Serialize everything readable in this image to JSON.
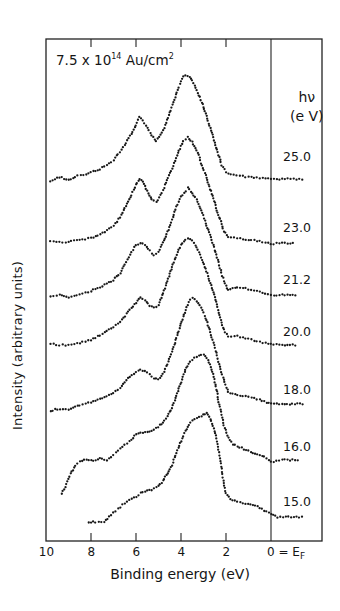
{
  "chart_data": {
    "type": "scatter",
    "title": "",
    "annotation": "7.5 x 10^14 Au/cm^2",
    "annotation_parts": {
      "base": "7.5 x 10",
      "exp": "14",
      "unit": " Au/cm",
      "unit_exp": "2"
    },
    "xlabel": "Binding energy (eV)",
    "ylabel": "Intensity (arbitrary units)",
    "x_reversed": true,
    "xlim": [
      10,
      -1.6
    ],
    "x_ticks": [
      10,
      8,
      6,
      4,
      2,
      0
    ],
    "x_tick_labels": [
      "10",
      "8",
      "6",
      "4",
      "2",
      "0 = E_F"
    ],
    "fermi_line_at": 0,
    "legend_title": "hν (eV)",
    "legend_title_parts": {
      "line1": "hν",
      "line2": "(e V)"
    },
    "grid": false,
    "series": [
      {
        "name": "25.0",
        "offset": 179,
        "label_y": 157,
        "points": [
          [
            9.8,
            -3
          ],
          [
            9.4,
            2
          ],
          [
            9.0,
            -1
          ],
          [
            8.6,
            3
          ],
          [
            8.2,
            4
          ],
          [
            8.0,
            7
          ],
          [
            7.6,
            10
          ],
          [
            7.2,
            15
          ],
          [
            7.0,
            19
          ],
          [
            6.8,
            25
          ],
          [
            6.5,
            34
          ],
          [
            6.2,
            45
          ],
          [
            6.0,
            54
          ],
          [
            5.85,
            62
          ],
          [
            5.7,
            58
          ],
          [
            5.5,
            51
          ],
          [
            5.3,
            44
          ],
          [
            5.1,
            38
          ],
          [
            4.9,
            44
          ],
          [
            4.7,
            54
          ],
          [
            4.5,
            66
          ],
          [
            4.3,
            79
          ],
          [
            4.1,
            92
          ],
          [
            3.9,
            102
          ],
          [
            3.8,
            104
          ],
          [
            3.6,
            102
          ],
          [
            3.4,
            94
          ],
          [
            3.2,
            84
          ],
          [
            3.0,
            72
          ],
          [
            2.8,
            58
          ],
          [
            2.6,
            44
          ],
          [
            2.4,
            29
          ],
          [
            2.2,
            14
          ],
          [
            2.0,
            7
          ],
          [
            1.8,
            4
          ],
          [
            1.4,
            3
          ],
          [
            1.0,
            2
          ],
          [
            0.5,
            1
          ],
          [
            0,
            0
          ],
          [
            -0.5,
            0
          ],
          [
            -1.0,
            0
          ],
          [
            -1.5,
            0
          ]
        ]
      },
      {
        "name": "23.0",
        "offset": 243,
        "label_y": 228,
        "points": [
          [
            9.8,
            2
          ],
          [
            9.4,
            1
          ],
          [
            9.0,
            1
          ],
          [
            8.5,
            3
          ],
          [
            8.0,
            5
          ],
          [
            7.5,
            10
          ],
          [
            7.0,
            17
          ],
          [
            6.7,
            26
          ],
          [
            6.5,
            35
          ],
          [
            6.2,
            48
          ],
          [
            6.0,
            58
          ],
          [
            5.85,
            64
          ],
          [
            5.7,
            61
          ],
          [
            5.5,
            52
          ],
          [
            5.3,
            44
          ],
          [
            5.1,
            41
          ],
          [
            4.9,
            48
          ],
          [
            4.7,
            58
          ],
          [
            4.5,
            70
          ],
          [
            4.3,
            80
          ],
          [
            4.1,
            92
          ],
          [
            3.9,
            102
          ],
          [
            3.7,
            106
          ],
          [
            3.5,
            101
          ],
          [
            3.3,
            93
          ],
          [
            3.1,
            80
          ],
          [
            2.9,
            68
          ],
          [
            2.7,
            54
          ],
          [
            2.5,
            40
          ],
          [
            2.3,
            26
          ],
          [
            2.1,
            12
          ],
          [
            1.9,
            6
          ],
          [
            1.5,
            5
          ],
          [
            1.0,
            3
          ],
          [
            0.5,
            2
          ],
          [
            0,
            -1
          ],
          [
            -0.5,
            0
          ],
          [
            -1.1,
            0
          ]
        ]
      },
      {
        "name": "21.2",
        "offset": 295,
        "label_y": 280,
        "points": [
          [
            9.8,
            -1
          ],
          [
            9.4,
            0
          ],
          [
            9.0,
            -2
          ],
          [
            8.5,
            1
          ],
          [
            8.0,
            4
          ],
          [
            7.5,
            9
          ],
          [
            7.0,
            15
          ],
          [
            6.7,
            22
          ],
          [
            6.5,
            31
          ],
          [
            6.2,
            43
          ],
          [
            6.0,
            50
          ],
          [
            5.8,
            52
          ],
          [
            5.6,
            50
          ],
          [
            5.4,
            44
          ],
          [
            5.2,
            40
          ],
          [
            5.0,
            43
          ],
          [
            4.8,
            52
          ],
          [
            4.6,
            63
          ],
          [
            4.4,
            75
          ],
          [
            4.2,
            88
          ],
          [
            4.0,
            98
          ],
          [
            3.8,
            104
          ],
          [
            3.7,
            107
          ],
          [
            3.5,
            102
          ],
          [
            3.3,
            95
          ],
          [
            3.1,
            84
          ],
          [
            2.9,
            72
          ],
          [
            2.7,
            60
          ],
          [
            2.5,
            45
          ],
          [
            2.3,
            30
          ],
          [
            2.1,
            14
          ],
          [
            1.9,
            5
          ],
          [
            1.5,
            8
          ],
          [
            1.0,
            6
          ],
          [
            0.5,
            3
          ],
          [
            0,
            0
          ],
          [
            -0.5,
            0
          ],
          [
            -1.2,
            0
          ]
        ]
      },
      {
        "name": "20.0",
        "offset": 345,
        "label_y": 332,
        "points": [
          [
            9.8,
            1
          ],
          [
            9.4,
            0
          ],
          [
            9.0,
            0
          ],
          [
            8.5,
            2
          ],
          [
            8.0,
            5
          ],
          [
            7.5,
            11
          ],
          [
            7.0,
            18
          ],
          [
            6.7,
            23
          ],
          [
            6.5,
            29
          ],
          [
            6.2,
            37
          ],
          [
            6.0,
            42
          ],
          [
            5.8,
            48
          ],
          [
            5.6,
            45
          ],
          [
            5.4,
            39
          ],
          [
            5.2,
            37
          ],
          [
            5.0,
            40
          ],
          [
            4.8,
            52
          ],
          [
            4.6,
            64
          ],
          [
            4.4,
            78
          ],
          [
            4.2,
            90
          ],
          [
            4.0,
            100
          ],
          [
            3.8,
            105
          ],
          [
            3.7,
            107
          ],
          [
            3.5,
            104
          ],
          [
            3.3,
            98
          ],
          [
            3.1,
            88
          ],
          [
            2.9,
            76
          ],
          [
            2.7,
            62
          ],
          [
            2.5,
            48
          ],
          [
            2.3,
            30
          ],
          [
            2.1,
            15
          ],
          [
            1.9,
            8
          ],
          [
            1.5,
            9
          ],
          [
            1.0,
            6
          ],
          [
            0.5,
            3
          ],
          [
            0,
            1
          ],
          [
            -0.5,
            0
          ],
          [
            -1.2,
            0
          ]
        ]
      },
      {
        "name": "18.0",
        "offset": 404,
        "label_y": 390,
        "points": [
          [
            9.8,
            -7
          ],
          [
            9.5,
            -5
          ],
          [
            9.0,
            -6
          ],
          [
            8.5,
            -1
          ],
          [
            8.0,
            2
          ],
          [
            7.5,
            6
          ],
          [
            7.0,
            11
          ],
          [
            6.7,
            16
          ],
          [
            6.5,
            22
          ],
          [
            6.2,
            29
          ],
          [
            6.0,
            32
          ],
          [
            5.8,
            34
          ],
          [
            5.6,
            33
          ],
          [
            5.4,
            30
          ],
          [
            5.2,
            26
          ],
          [
            5.0,
            25
          ],
          [
            4.8,
            30
          ],
          [
            4.6,
            40
          ],
          [
            4.4,
            52
          ],
          [
            4.2,
            66
          ],
          [
            4.0,
            80
          ],
          [
            3.8,
            94
          ],
          [
            3.6,
            104
          ],
          [
            3.5,
            106
          ],
          [
            3.3,
            103
          ],
          [
            3.1,
            96
          ],
          [
            2.9,
            86
          ],
          [
            2.7,
            72
          ],
          [
            2.5,
            56
          ],
          [
            2.3,
            40
          ],
          [
            2.1,
            24
          ],
          [
            1.9,
            12
          ],
          [
            1.5,
            9
          ],
          [
            1.0,
            7
          ],
          [
            0.5,
            4
          ],
          [
            0,
            0
          ],
          [
            -0.5,
            0
          ],
          [
            -1.5,
            0
          ]
        ]
      },
      {
        "name": "16.0",
        "offset": 460,
        "label_y": 447,
        "points": [
          [
            9.3,
            -34
          ],
          [
            9.1,
            -24
          ],
          [
            8.9,
            -14
          ],
          [
            8.7,
            -6
          ],
          [
            8.5,
            -2
          ],
          [
            8.2,
            1
          ],
          [
            7.9,
            -1
          ],
          [
            7.6,
            2
          ],
          [
            7.3,
            0
          ],
          [
            7.0,
            5
          ],
          [
            6.8,
            9
          ],
          [
            6.5,
            15
          ],
          [
            6.2,
            20
          ],
          [
            6.0,
            26
          ],
          [
            5.8,
            27
          ],
          [
            5.5,
            28
          ],
          [
            5.2,
            30
          ],
          [
            5.0,
            33
          ],
          [
            4.8,
            38
          ],
          [
            4.6,
            44
          ],
          [
            4.4,
            52
          ],
          [
            4.2,
            64
          ],
          [
            4.0,
            78
          ],
          [
            3.8,
            90
          ],
          [
            3.6,
            98
          ],
          [
            3.4,
            102
          ],
          [
            3.2,
            105
          ],
          [
            3.0,
            105
          ],
          [
            2.8,
            100
          ],
          [
            2.6,
            88
          ],
          [
            2.5,
            78
          ],
          [
            2.3,
            56
          ],
          [
            2.1,
            35
          ],
          [
            1.9,
            22
          ],
          [
            1.7,
            16
          ],
          [
            1.4,
            13
          ],
          [
            1.0,
            9
          ],
          [
            0.6,
            6
          ],
          [
            0.2,
            2
          ],
          [
            0,
            -2
          ],
          [
            -0.5,
            0
          ],
          [
            -1.3,
            0
          ]
        ]
      },
      {
        "name": "15.0",
        "offset": 517,
        "label_y": 502,
        "points": [
          [
            8.1,
            -5
          ],
          [
            7.8,
            -5
          ],
          [
            7.4,
            -5
          ],
          [
            7.2,
            0
          ],
          [
            7.0,
            4
          ],
          [
            6.8,
            8
          ],
          [
            6.5,
            14
          ],
          [
            6.2,
            18
          ],
          [
            6.0,
            20
          ],
          [
            5.8,
            24
          ],
          [
            5.5,
            26
          ],
          [
            5.2,
            28
          ],
          [
            5.0,
            31
          ],
          [
            4.8,
            36
          ],
          [
            4.6,
            44
          ],
          [
            4.4,
            52
          ],
          [
            4.2,
            64
          ],
          [
            4.0,
            76
          ],
          [
            3.8,
            86
          ],
          [
            3.6,
            94
          ],
          [
            3.4,
            98
          ],
          [
            3.2,
            100
          ],
          [
            3.0,
            102
          ],
          [
            2.85,
            104
          ],
          [
            2.7,
            98
          ],
          [
            2.5,
            86
          ],
          [
            2.4,
            76
          ],
          [
            2.3,
            62
          ],
          [
            2.2,
            48
          ],
          [
            2.1,
            34
          ],
          [
            2.0,
            24
          ],
          [
            1.8,
            18
          ],
          [
            1.5,
            15
          ],
          [
            1.0,
            13
          ],
          [
            0.6,
            11
          ],
          [
            0.3,
            6
          ],
          [
            0,
            3
          ],
          [
            -0.3,
            0
          ],
          [
            -1.5,
            0
          ]
        ]
      }
    ]
  }
}
